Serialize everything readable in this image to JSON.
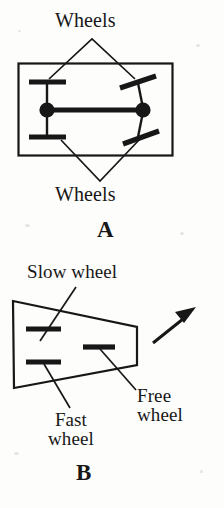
{
  "figure": {
    "kind": "two-panel line diagram of wheeled vehicle steering configurations",
    "background_color": "#fdfdfc",
    "ink_color": "#171717"
  },
  "panel_a": {
    "caption": "A",
    "label_top": "Wheels",
    "label_bottom": "Wheels",
    "body_shape": "rectangle",
    "parts": {
      "left_wheels": "two horizontal wheel bars on a vertical axle",
      "right_wheels": "two tilted (steered) wheel bars",
      "pivots": "two filled circular joints joined by a thick horizontal bar"
    }
  },
  "panel_b": {
    "caption": "B",
    "label_slow": "Slow wheel",
    "label_fast_line1": "Fast",
    "label_fast_line2": "wheel",
    "label_free_line1": "Free",
    "label_free_line2": "wheel",
    "body_shape": "trapezoid (left side tall, right side short) indicating a turn",
    "direction_arrow": "arrow pointing up and to the right (direction of travel)",
    "parts": {
      "slow_wheel": "upper-left horizontal bar",
      "fast_wheel": "lower-left horizontal bar",
      "free_wheel": "middle-right horizontal bar"
    }
  },
  "colors": {
    "ink": "#171717",
    "paper": "#fdfdfc"
  }
}
